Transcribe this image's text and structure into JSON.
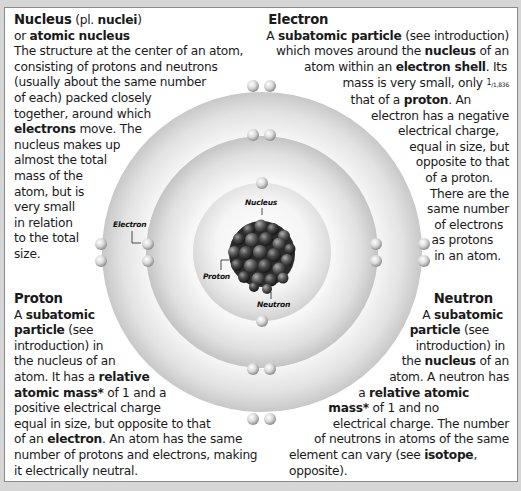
{
  "diagram": {
    "labels": {
      "electron": "Electron",
      "nucleus": "Nucleus",
      "proton": "Proton",
      "neutron": "Neutron"
    },
    "shells": [
      {
        "name": "inner",
        "electron_count": 2
      },
      {
        "name": "middle",
        "electron_count": 8
      },
      {
        "name": "outer",
        "electron_count": 8
      }
    ],
    "colors": {
      "background": "#d6d6d6",
      "panel": "#ffffff",
      "shell_light": "#f4f4f4",
      "shell_dark": "#c9c9c9",
      "nucleus_particle": "#3a3a3a"
    }
  },
  "nucleus_block": {
    "title": "Nucleus",
    "title_suffix_pre": " (pl. ",
    "plural": "nuclei",
    "title_suffix_post": ")",
    "alt_prefix": "or ",
    "alt_name": "atomic nucleus",
    "lines": [
      "The structure at the center of an atom,",
      "consisting of protons and neutrons",
      "(usually about the same number",
      "of each) packed closely",
      "together, around which"
    ],
    "bold_word": "electrons",
    "line_after_bold": " move. The",
    "lines_tail": [
      "nucleus makes up",
      "almost the total",
      "mass of the",
      "atom, but is",
      "very small",
      "in relation",
      "to the total",
      "size."
    ]
  },
  "electron_block": {
    "title": "Electron",
    "l1_pre": "A ",
    "l1_bold": "subatomic particle",
    "l1_post": " (see introduction)",
    "l2_pre": "which moves around the ",
    "l2_bold": "nucleus",
    "l2_post": " of an",
    "l3_pre": "atom within an ",
    "l3_bold": "electron shell",
    "l3_post": ". Its",
    "l4_pre": "mass is very small, only ",
    "fraction_num": "1",
    "fraction_den": "/1,836",
    "l5_pre": "that of a ",
    "l5_bold": "proton",
    "l5_post": ". An",
    "lines_tail": [
      "electron has a negative",
      "electrical charge,",
      "equal in size, but",
      "opposite to that",
      "of a proton.",
      "There are the",
      "same number",
      "of electrons",
      "as protons",
      "in an atom."
    ]
  },
  "proton_block": {
    "title": "Proton",
    "l1_pre": "A ",
    "l1_bold": "subatomic",
    "l2_bold": "particle",
    "l2_post": " (see",
    "l3": "introduction) in",
    "l4": "the nucleus of an",
    "l5_pre": "atom. It has a ",
    "l5_bold": "relative",
    "l6_bold": "atomic mass*",
    "l6_post": " of 1 and a",
    "l7": "positive electrical charge",
    "l8": "equal in size, but opposite to that",
    "l9_pre": "of an ",
    "l9_bold": "electron",
    "l9_post": ". An atom has the same",
    "l10": "number of protons and electrons, making",
    "l11": "it electrically neutral."
  },
  "neutron_block": {
    "title": "Neutron",
    "l1_pre": "A ",
    "l1_bold": "subatomic",
    "l2_bold": "particle",
    "l2_post": " (see",
    "l3": "introduction) in",
    "l4_pre": "the ",
    "l4_bold": "nucleus",
    "l4_post": " of an",
    "l5": "atom. A neutron has",
    "l6_pre": "a ",
    "l6_bold": "relative atomic",
    "l7_bold": "mass*",
    "l7_post": " of 1 and no",
    "l8": "electrical charge. The number",
    "l9": "of neutrons in atoms of the same",
    "l10_pre": "element can vary (see ",
    "l10_bold": "isotope",
    "l10_post": ",",
    "l11": "opposite)."
  }
}
